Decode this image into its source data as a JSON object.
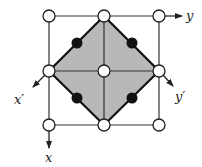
{
  "diagram": {
    "colors": {
      "line": "#333333",
      "shade": "#b8b8b8",
      "open_site_fill": "#ffffff",
      "filled_site": "#111111"
    },
    "grid": {
      "xs": [
        49,
        104,
        159
      ],
      "ys": [
        16,
        71,
        125
      ]
    },
    "open_sites": [
      {
        "x": 49,
        "y": 16
      },
      {
        "x": 104,
        "y": 16
      },
      {
        "x": 159,
        "y": 16
      },
      {
        "x": 49,
        "y": 71
      },
      {
        "x": 104,
        "y": 71
      },
      {
        "x": 159,
        "y": 71
      },
      {
        "x": 49,
        "y": 125
      },
      {
        "x": 104,
        "y": 125
      },
      {
        "x": 159,
        "y": 125
      }
    ],
    "filled_sites": [
      {
        "x": 77,
        "y": 43
      },
      {
        "x": 132,
        "y": 43
      },
      {
        "x": 77,
        "y": 98
      },
      {
        "x": 132,
        "y": 98
      }
    ],
    "axes": {
      "y": {
        "label": "y",
        "from": [
          164,
          16
        ],
        "to": [
          182,
          16
        ],
        "label_pos": [
          186,
          20
        ]
      },
      "x": {
        "label": "x",
        "from": [
          49,
          131
        ],
        "to": [
          49,
          148
        ],
        "label_pos": [
          45,
          162
        ]
      },
      "x_prime": {
        "label": "x′",
        "from": [
          45,
          75
        ],
        "to": [
          33,
          87
        ],
        "label_pos": [
          14,
          104
        ]
      },
      "y_prime": {
        "label": "y′",
        "from": [
          163,
          75
        ],
        "to": [
          173,
          86
        ],
        "label_pos": [
          175,
          101
        ]
      }
    }
  }
}
